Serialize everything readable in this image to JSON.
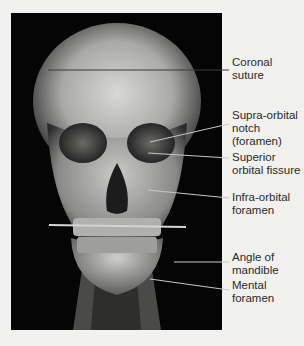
{
  "figure": {
    "labels": [
      {
        "id": "coronal-suture",
        "text": "Coronal\nsuture"
      },
      {
        "id": "supra-orbital-notch",
        "text": "Supra-orbital\nnotch\n(foramen)"
      },
      {
        "id": "superior-orbital-fissure",
        "text": "Superior\norbital fissure"
      },
      {
        "id": "infra-orbital-foramen",
        "text": "Infra-orbital\nforamen"
      },
      {
        "id": "angle-of-mandible",
        "text": "Angle of\nmandible"
      },
      {
        "id": "mental-foramen",
        "text": "Mental\nforamen"
      }
    ]
  }
}
